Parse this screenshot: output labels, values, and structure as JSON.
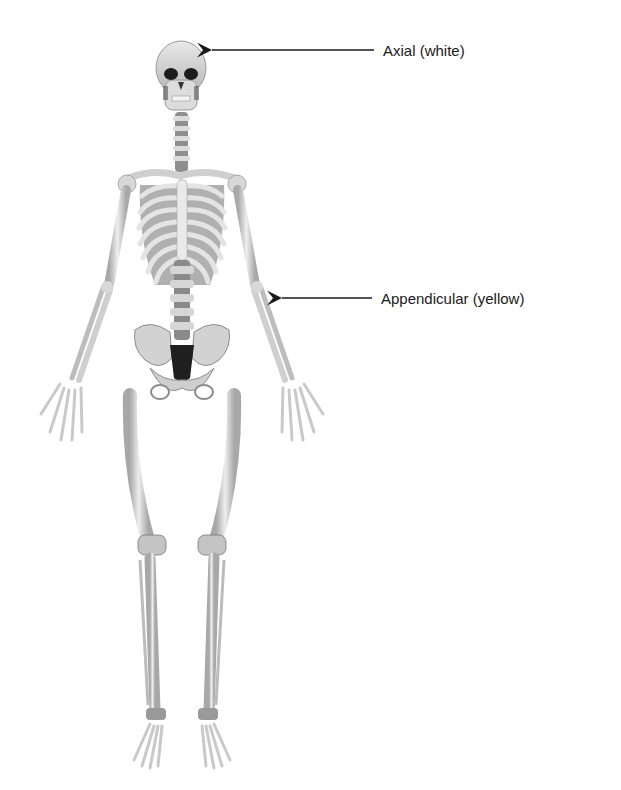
{
  "figure": {
    "labels": [
      {
        "id": "axial",
        "text": "Axial (white)",
        "points_to": "skull"
      },
      {
        "id": "appendicular",
        "text": "Appendicular (yellow)",
        "points_to": "left forearm"
      }
    ]
  },
  "colors": {
    "bone_light": "#ececec",
    "bone_mid": "#c9c9c9",
    "bone_shadow": "#8c8c8c",
    "dark": "#1c1c1c",
    "text": "#1a1a1a",
    "arrow": "#1a1a1a"
  }
}
